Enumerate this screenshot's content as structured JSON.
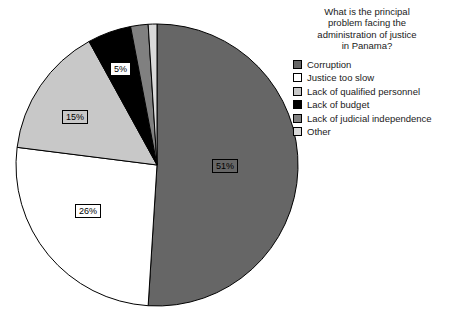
{
  "chart_data": {
    "type": "pie",
    "title_lines": [
      "What is the principal",
      "problem facing the",
      "administration of justice",
      "in Panama?"
    ],
    "xlabel": "",
    "ylabel": "",
    "legend_position": "right",
    "grid": false,
    "categories": [
      "Corruption",
      "Justice too slow",
      "Lack of qualified personnel",
      "Lack of budget",
      "Lack of judicial independence",
      "Other"
    ],
    "values": [
      51,
      26,
      15,
      5,
      2,
      1
    ],
    "value_labels": [
      "51%",
      "26%",
      "15%",
      "5%",
      "",
      ""
    ],
    "colors": [
      "#666666",
      "#ffffff",
      "#c8c8c8",
      "#000000",
      "#808080",
      "#d9d9d9"
    ],
    "slices": [
      {
        "label": "Corruption",
        "value": 51,
        "display": "51%",
        "color": "#666666",
        "label_color": "#000000",
        "label_bg": "#666666"
      },
      {
        "label": "Justice too slow",
        "value": 26,
        "display": "26%",
        "color": "#ffffff",
        "label_color": "#000000",
        "label_bg": "#ffffff"
      },
      {
        "label": "Lack of qualified personnel",
        "value": 15,
        "display": "15%",
        "color": "#c8c8c8",
        "label_color": "#000000",
        "label_bg": "#c8c8c8"
      },
      {
        "label": "Lack of budget",
        "value": 5,
        "display": "5%",
        "color": "#000000",
        "label_color": "#000000",
        "label_bg": "#ffffff"
      },
      {
        "label": "Lack of judicial independence",
        "value": 2,
        "display": "",
        "color": "#808080",
        "label_color": "#000000",
        "label_bg": "#808080"
      },
      {
        "label": "Other",
        "value": 1,
        "display": "",
        "color": "#d9d9d9",
        "label_color": "#000000",
        "label_bg": "#d9d9d9"
      }
    ]
  },
  "legend": {
    "items": [
      {
        "label": "Corruption",
        "color": "#666666"
      },
      {
        "label": "Justice too slow",
        "color": "#ffffff"
      },
      {
        "label": "Lack of qualified personnel",
        "color": "#c8c8c8"
      },
      {
        "label": "Lack of budget",
        "color": "#000000"
      },
      {
        "label": "Lack of judicial independence",
        "color": "#808080"
      },
      {
        "label": "Other",
        "color": "#d9d9d9"
      }
    ]
  },
  "data_labels": [
    {
      "text": "51%",
      "x": 212,
      "y": 159,
      "bg": "#666666",
      "fg": "#000000"
    },
    {
      "text": "26%",
      "x": 75,
      "y": 204,
      "bg": "#ffffff",
      "fg": "#000000"
    },
    {
      "text": "15%",
      "x": 62,
      "y": 110,
      "bg": "#c8c8c8",
      "fg": "#000000"
    },
    {
      "text": "5%",
      "x": 110,
      "y": 62,
      "bg": "#ffffff",
      "fg": "#000000"
    }
  ],
  "geometry": {
    "cx": 157,
    "cy": 165,
    "r": 141,
    "start_angle_deg": -90
  }
}
